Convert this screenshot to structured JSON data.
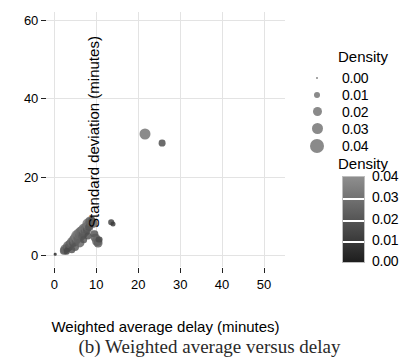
{
  "chart_data": {
    "type": "scatter",
    "title": "",
    "xlabel": "Weighted average delay  (minutes)",
    "ylabel": "Standard deviation (minutes)",
    "xlim": [
      -2,
      55
    ],
    "ylim": [
      -3,
      62
    ],
    "xticks": [
      0,
      10,
      20,
      30,
      40,
      50
    ],
    "yticks": [
      0,
      20,
      40,
      60
    ],
    "xtick_labels": [
      "0",
      "10",
      "20",
      "30",
      "40",
      "50"
    ],
    "ytick_labels": [
      "0",
      "20",
      "40",
      "60"
    ],
    "grid": true,
    "grid_color": "#e3e3e3",
    "legend_position": "right",
    "size_encoding": "Density",
    "color_encoding": "Density",
    "points": [
      {
        "x": 0.2,
        "y": 0.2,
        "density": 0.002
      },
      {
        "x": 2.3,
        "y": 1.1,
        "density": 0.021
      },
      {
        "x": 2.6,
        "y": 1.5,
        "density": 0.024
      },
      {
        "x": 2.9,
        "y": 1.8,
        "density": 0.02
      },
      {
        "x": 3.2,
        "y": 2.3,
        "density": 0.026
      },
      {
        "x": 3.5,
        "y": 2.0,
        "density": 0.018
      },
      {
        "x": 3.8,
        "y": 2.8,
        "density": 0.023
      },
      {
        "x": 4.1,
        "y": 3.3,
        "density": 0.027
      },
      {
        "x": 4.4,
        "y": 3.0,
        "density": 0.019
      },
      {
        "x": 4.6,
        "y": 3.8,
        "density": 0.025
      },
      {
        "x": 4.9,
        "y": 4.2,
        "density": 0.03
      },
      {
        "x": 5.1,
        "y": 3.6,
        "density": 0.022
      },
      {
        "x": 5.3,
        "y": 4.6,
        "density": 0.028
      },
      {
        "x": 5.5,
        "y": 5.0,
        "density": 0.033
      },
      {
        "x": 5.7,
        "y": 4.3,
        "density": 0.024
      },
      {
        "x": 5.9,
        "y": 5.4,
        "density": 0.031
      },
      {
        "x": 6.1,
        "y": 4.9,
        "density": 0.026
      },
      {
        "x": 6.3,
        "y": 5.8,
        "density": 0.029
      },
      {
        "x": 6.5,
        "y": 5.2,
        "density": 0.023
      },
      {
        "x": 6.7,
        "y": 6.2,
        "density": 0.027
      },
      {
        "x": 6.9,
        "y": 5.6,
        "density": 0.021
      },
      {
        "x": 7.1,
        "y": 6.6,
        "density": 0.03
      },
      {
        "x": 7.3,
        "y": 6.0,
        "density": 0.022
      },
      {
        "x": 7.5,
        "y": 7.0,
        "density": 0.028
      },
      {
        "x": 7.7,
        "y": 6.4,
        "density": 0.02
      },
      {
        "x": 7.9,
        "y": 7.5,
        "density": 0.026
      },
      {
        "x": 8.1,
        "y": 8.0,
        "density": 0.031
      },
      {
        "x": 8.3,
        "y": 7.2,
        "density": 0.019
      },
      {
        "x": 8.6,
        "y": 8.6,
        "density": 0.024
      },
      {
        "x": 8.9,
        "y": 9.1,
        "density": 0.017
      },
      {
        "x": 9.2,
        "y": 8.2,
        "density": 0.022
      },
      {
        "x": 9.5,
        "y": 5.4,
        "density": 0.018
      },
      {
        "x": 9.8,
        "y": 4.4,
        "density": 0.021
      },
      {
        "x": 10.1,
        "y": 3.6,
        "density": 0.026
      },
      {
        "x": 10.4,
        "y": 3.1,
        "density": 0.023
      },
      {
        "x": 10.7,
        "y": 4.0,
        "density": 0.016
      },
      {
        "x": 4.2,
        "y": 1.4,
        "density": 0.018
      },
      {
        "x": 3.0,
        "y": 1.0,
        "density": 0.015
      },
      {
        "x": 5.0,
        "y": 2.2,
        "density": 0.02
      },
      {
        "x": 6.0,
        "y": 3.2,
        "density": 0.024
      },
      {
        "x": 7.0,
        "y": 4.0,
        "density": 0.019
      },
      {
        "x": 8.0,
        "y": 4.8,
        "density": 0.017
      },
      {
        "x": 13.6,
        "y": 8.4,
        "density": 0.012
      },
      {
        "x": 13.9,
        "y": 7.9,
        "density": 0.01
      },
      {
        "x": 21.5,
        "y": 31.0,
        "density": 0.03
      },
      {
        "x": 25.6,
        "y": 28.6,
        "density": 0.016
      }
    ],
    "size_legend": {
      "title": "Density",
      "entries": [
        {
          "label": "0.00",
          "value": 0.0,
          "dot_px": 2
        },
        {
          "label": "0.01",
          "value": 0.01,
          "dot_px": 6
        },
        {
          "label": "0.02",
          "value": 0.02,
          "dot_px": 9
        },
        {
          "label": "0.03",
          "value": 0.03,
          "dot_px": 11
        },
        {
          "label": "0.04",
          "value": 0.04,
          "dot_px": 14
        }
      ],
      "dot_color": "#8a8a8a"
    },
    "color_legend": {
      "title": "Density",
      "labels": [
        "0.04",
        "0.03",
        "0.02",
        "0.01",
        "0.00"
      ],
      "values": [
        0.04,
        0.03,
        0.02,
        0.01,
        0.0
      ],
      "gradient_top_color": "#8e8e8e",
      "gradient_bottom_color": "#1e1e1e",
      "orientation": "vertical"
    }
  },
  "caption": {
    "text": "(b)  Weighted average versus delay"
  }
}
